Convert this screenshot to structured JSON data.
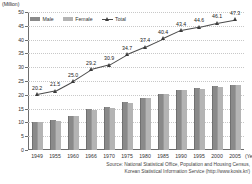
{
  "unit_label": "(Million)",
  "legend": {
    "position": "top-left-inside",
    "items": [
      {
        "label": "Male",
        "type": "bar",
        "color": "#8a8a8a",
        "icon": "legend-bar-swatch"
      },
      {
        "label": "Female",
        "type": "bar",
        "color": "#b4b4b4",
        "icon": "legend-bar-swatch"
      },
      {
        "label": "Total",
        "type": "line",
        "color": "#3a3a3a",
        "icon": "legend-line-marker"
      }
    ]
  },
  "axes": {
    "x_unit_label": "(Year)",
    "y_ticks": [
      "0",
      "5",
      "10",
      "15",
      "20",
      "25",
      "30",
      "35",
      "40",
      "45",
      "50"
    ],
    "x_ticks": [
      "1949",
      "1955",
      "1960",
      "1966",
      "1970",
      "1975",
      "1980",
      "1985",
      "1990",
      "1995",
      "2000",
      "2005"
    ]
  },
  "source": {
    "line1": "Source: National Statistical Office, Population and Housing Census,",
    "line2": "Korean Statistical Information Service (http://www.kosis.kr/)"
  },
  "chart_data": {
    "type": "bar",
    "title": "",
    "xlabel": "(Year)",
    "ylabel": "(Million)",
    "ylim": [
      0,
      50
    ],
    "ytick_step": 5,
    "grid": true,
    "legend_position": "top-left",
    "categories": [
      "1949",
      "1955",
      "1960",
      "1966",
      "1970",
      "1975",
      "1980",
      "1985",
      "1990",
      "1995",
      "2000",
      "2005"
    ],
    "series": [
      {
        "name": "Male",
        "type": "bar",
        "color": "#8a8a8a",
        "values": [
          10.1,
          10.9,
          12.5,
          14.7,
          15.5,
          17.5,
          18.7,
          20.2,
          21.8,
          22.4,
          23.1,
          23.6
        ]
      },
      {
        "name": "Female",
        "type": "bar",
        "color": "#b4b4b4",
        "values": [
          10.1,
          10.6,
          12.5,
          14.5,
          15.4,
          17.2,
          18.7,
          20.2,
          21.6,
          22.2,
          23.0,
          23.7
        ]
      },
      {
        "name": "Total",
        "type": "line",
        "color": "#3a3a3a",
        "marker": "triangle",
        "values": [
          20.2,
          21.5,
          25.0,
          29.2,
          30.9,
          34.7,
          37.4,
          40.4,
          43.4,
          44.6,
          46.1,
          47.3
        ],
        "data_labels": [
          "20.2",
          "21.5",
          "25.0",
          "29.2",
          "30.9",
          "34.7",
          "37.4",
          "40.4",
          "43.4",
          "44.6",
          "46.1",
          "47.3"
        ]
      }
    ]
  }
}
